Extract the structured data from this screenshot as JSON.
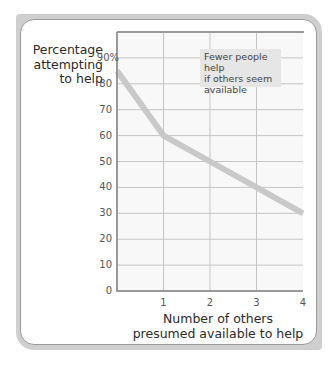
{
  "chart_data": {
    "type": "line",
    "title": "",
    "xlabel": "Number of others presumed available to help",
    "xlabel_lines": [
      "Number of others",
      "presumed available to help"
    ],
    "ylabel": "Percentage attempting to help",
    "ylabel_lines": [
      "Percentage",
      "attempting",
      "to help"
    ],
    "x": [
      0,
      1,
      2,
      3,
      4
    ],
    "series": [
      {
        "name": "Percentage attempting to help",
        "values": [
          85,
          60,
          50,
          40,
          30
        ],
        "color": "#c9c9c9"
      }
    ],
    "xlim": [
      0,
      4
    ],
    "ylim": [
      0,
      100
    ],
    "xticks": [
      "1",
      "2",
      "3",
      "4"
    ],
    "yticks": [
      "0",
      "10",
      "20",
      "30",
      "40",
      "50",
      "60",
      "70",
      "80",
      "90%"
    ],
    "grid": true,
    "annotation": "Fewer people help if others seem available",
    "annotation_lines": [
      "Fewer people help",
      "if others seem",
      "available"
    ]
  },
  "colors": {
    "frame": "#cfcfcf",
    "grid": "#c4c4c4",
    "axis": "#9a9a9a",
    "line": "#c9c9c9",
    "plot_bg": "#f8f8f8",
    "callout_bg": "#e6e6e6"
  }
}
